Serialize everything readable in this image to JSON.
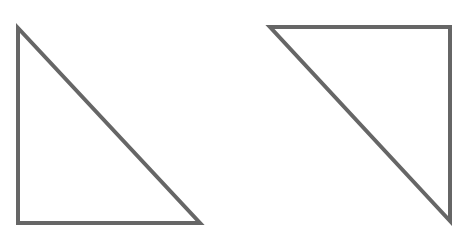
{
  "diagram": {
    "width": 457,
    "height": 243,
    "background": "#ffffff",
    "stroke_color": "#666666",
    "stroke_width": 4,
    "shapes": [
      {
        "name": "left-right-triangle",
        "type": "triangle",
        "orientation": "right angle at bottom-left",
        "points": [
          [
            18,
            28
          ],
          [
            18,
            223
          ],
          [
            200,
            223
          ]
        ]
      },
      {
        "name": "right-right-triangle",
        "type": "triangle",
        "orientation": "right angle at top-right",
        "points": [
          [
            270,
            27
          ],
          [
            450,
            27
          ],
          [
            450,
            221
          ]
        ]
      }
    ]
  }
}
